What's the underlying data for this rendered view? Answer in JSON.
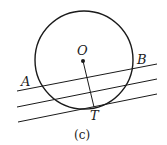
{
  "figure": {
    "caption": "(c)",
    "labels": {
      "center": "O",
      "point_a": "A",
      "point_b": "B",
      "tangent_point": "T"
    },
    "circle": {
      "cx": 84,
      "cy": 60,
      "r": 49
    },
    "lines": [
      {
        "name": "secant-ab",
        "x1": 17,
        "y1": 91,
        "x2": 157,
        "y2": 64
      },
      {
        "name": "middle-line",
        "x1": 17,
        "y1": 107,
        "x2": 157,
        "y2": 79
      },
      {
        "name": "tangent-line",
        "x1": 18,
        "y1": 122,
        "x2": 157,
        "y2": 94
      }
    ],
    "radius_segment": {
      "x1": 83,
      "y1": 61,
      "x2": 94,
      "y2": 107
    },
    "stroke_color": "#1a1a1a"
  }
}
